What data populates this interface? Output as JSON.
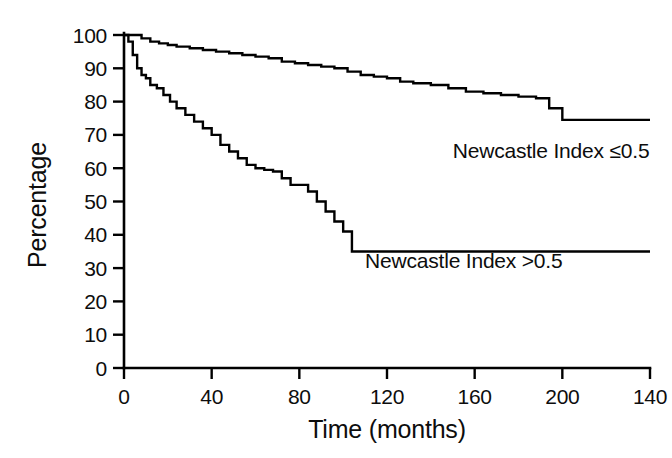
{
  "chart_data": {
    "type": "line",
    "title": "",
    "subtitle": "",
    "xlabel": "Time (months)",
    "ylabel": "Percentage",
    "xlim": [
      0,
      240
    ],
    "ylim": [
      0,
      100
    ],
    "grid": false,
    "legend_position": "inline-annotation",
    "x_tick_labels": [
      "0",
      "40",
      "80",
      "120",
      "160",
      "200",
      "140"
    ],
    "x_tick_values": [
      0,
      40,
      80,
      120,
      160,
      200,
      240
    ],
    "y_tick_labels": [
      "0",
      "10",
      "20",
      "30",
      "40",
      "50",
      "60",
      "70",
      "80",
      "90",
      "100"
    ],
    "y_tick_values": [
      0,
      10,
      20,
      30,
      40,
      50,
      60,
      70,
      80,
      90,
      100
    ],
    "annotations": [
      {
        "text": "Newcastle Index ≤0.5",
        "x": 150,
        "y": 63
      },
      {
        "text": "Newcastle Index >0.5",
        "x": 110,
        "y": 30
      }
    ],
    "series": [
      {
        "name": "Newcastle Index ≤0.5",
        "step": "post",
        "color": "#000000",
        "x": [
          0,
          4,
          8,
          12,
          16,
          20,
          24,
          30,
          36,
          42,
          48,
          54,
          60,
          66,
          72,
          78,
          84,
          90,
          96,
          102,
          108,
          114,
          120,
          126,
          132,
          140,
          148,
          156,
          164,
          172,
          180,
          188,
          194,
          200,
          240
        ],
        "y": [
          100,
          100,
          99,
          98,
          97.5,
          97,
          96.5,
          96,
          95.5,
          95,
          94.5,
          94,
          93.5,
          93,
          92,
          91.5,
          91,
          90.5,
          90,
          89,
          88,
          87.5,
          87,
          86,
          85.5,
          85,
          84,
          83,
          82.5,
          82,
          81.5,
          81,
          78,
          74.5,
          74.5
        ]
      },
      {
        "name": "Newcastle Index >0.5",
        "step": "post",
        "color": "#000000",
        "x": [
          0,
          2,
          4,
          6,
          8,
          10,
          12,
          15,
          18,
          21,
          24,
          28,
          32,
          36,
          40,
          44,
          48,
          52,
          56,
          60,
          64,
          68,
          72,
          76,
          80,
          84,
          88,
          92,
          96,
          100,
          104,
          240
        ],
        "y": [
          100,
          98,
          94,
          90,
          88,
          87,
          85,
          84,
          82,
          80,
          78,
          76,
          74,
          72,
          70,
          67,
          65,
          63,
          61,
          60,
          59.5,
          59,
          57,
          55,
          55,
          53,
          50,
          47,
          44,
          41,
          35,
          35
        ]
      }
    ]
  },
  "axes": {
    "y_title": "Percentage",
    "x_title": "Time (months)"
  }
}
